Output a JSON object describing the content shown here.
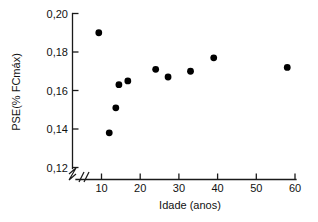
{
  "chart_data": {
    "type": "scatter",
    "title": "",
    "xlabel": "Idade (anos)",
    "ylabel": "PSE(% FCmáx)",
    "xlim": [
      5,
      62
    ],
    "ylim": [
      0.12,
      0.2
    ],
    "grid": false,
    "legend": null,
    "x_ticks": [
      "10",
      "20",
      "30",
      "40",
      "50",
      "60"
    ],
    "x_tick_values": [
      10,
      20,
      30,
      40,
      50,
      60
    ],
    "y_ticks": [
      "0,12",
      "0,14",
      "0,16",
      "0,18",
      "0,20"
    ],
    "y_tick_values": [
      0.12,
      0.14,
      0.16,
      0.18,
      0.2
    ],
    "axis_break": "//",
    "marker": "filled-circle",
    "marker_color": "#000000",
    "points": [
      {
        "x": 9.3,
        "y": 0.19
      },
      {
        "x": 12.0,
        "y": 0.138
      },
      {
        "x": 13.7,
        "y": 0.151
      },
      {
        "x": 14.5,
        "y": 0.163
      },
      {
        "x": 16.8,
        "y": 0.165
      },
      {
        "x": 24.0,
        "y": 0.171
      },
      {
        "x": 27.2,
        "y": 0.167
      },
      {
        "x": 33.0,
        "y": 0.17
      },
      {
        "x": 39.0,
        "y": 0.177
      },
      {
        "x": 58.0,
        "y": 0.172
      }
    ],
    "x": [
      9.3,
      12.0,
      13.7,
      14.5,
      16.8,
      24.0,
      27.2,
      33.0,
      39.0,
      58.0
    ],
    "values": [
      0.19,
      0.138,
      0.151,
      0.163,
      0.165,
      0.171,
      0.167,
      0.17,
      0.177,
      0.172
    ]
  },
  "axes": {
    "y_label": "PSE(% FCmáx)",
    "x_label": "Idade (anos)",
    "y_tick_labels": [
      "0,20",
      "0,18",
      "0,16",
      "0,14",
      "0,12"
    ],
    "x_tick_labels": [
      "10",
      "20",
      "30",
      "40",
      "50",
      "60"
    ]
  }
}
